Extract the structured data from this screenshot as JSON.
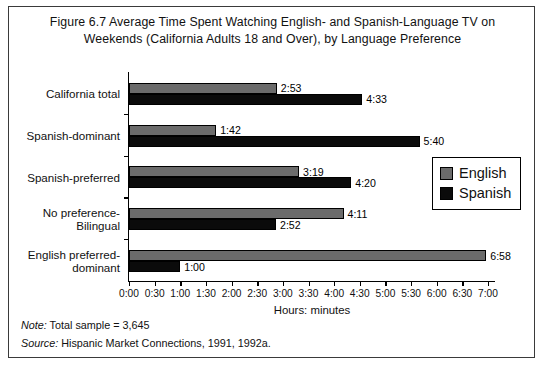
{
  "figure": {
    "title": "Figure 6.7   Average Time Spent Watching English- and Spanish-Language TV on Weekends (California Adults 18 and Over), by Language Preference",
    "note_label": "Note:",
    "note_text": " Total sample = 3,645",
    "source_label": "Source:",
    "source_text": " Hispanic Market Connections, 1991, 1992a."
  },
  "legend": {
    "position": "inside-right",
    "items": [
      {
        "label": "English",
        "color": "#6b6b6b"
      },
      {
        "label": "Spanish",
        "color": "#0b0b0b"
      }
    ]
  },
  "chart_data": {
    "type": "bar",
    "orientation": "horizontal",
    "title": "Figure 6.7   Average Time Spent Watching English- and Spanish-Language TV on Weekends (California Adults 18 and Over), by Language Preference",
    "xlabel": "Hours: minutes",
    "ylabel": "",
    "grid": false,
    "xlim": [
      0,
      7
    ],
    "units": "hours:minutes",
    "categories": [
      "California total",
      "Spanish-dominant",
      "Spanish-preferred",
      "No preference-Bilingual",
      "English preferred-dominant"
    ],
    "category_lines": [
      [
        "California total"
      ],
      [
        "Spanish-dominant"
      ],
      [
        "Spanish-preferred"
      ],
      [
        "No preference-",
        "Bilingual"
      ],
      [
        "English preferred-",
        "dominant"
      ]
    ],
    "tick_labels": [
      "0:00",
      "0:30",
      "1:00",
      "1:30",
      "2:00",
      "2:30",
      "3:00",
      "3:30",
      "4:00",
      "4:30",
      "5:00",
      "5:30",
      "6:00",
      "6:30",
      "7:00"
    ],
    "tick_values": [
      0,
      0.5,
      1,
      1.5,
      2,
      2.5,
      3,
      3.5,
      4,
      4.5,
      5,
      5.5,
      6,
      6.5,
      7
    ],
    "series": [
      {
        "name": "English",
        "color": "#6b6b6b",
        "labels": [
          "2:53",
          "1:42",
          "3:19",
          "4:11",
          "6:58"
        ],
        "values": [
          2.8833,
          1.7,
          3.3167,
          4.1833,
          6.9667
        ]
      },
      {
        "name": "Spanish",
        "color": "#0b0b0b",
        "labels": [
          "4:33",
          "5:40",
          "4:20",
          "2:52",
          "1:00"
        ],
        "values": [
          4.55,
          5.6667,
          4.3333,
          2.8667,
          1.0
        ]
      }
    ]
  }
}
